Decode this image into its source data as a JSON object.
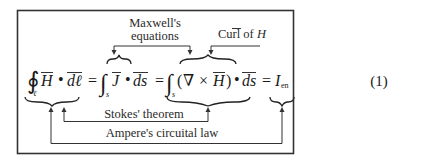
{
  "equation": {
    "number": "(1)",
    "terms": {
      "contour_integral_symbol": "∮",
      "contour_subscript": "ℓ",
      "H": "H",
      "dot": "•",
      "dl": "dℓ",
      "equals": "=",
      "surface_integral_symbol": "∫",
      "surface_subscript": "s",
      "J": "J",
      "ds": "ds",
      "open_paren": "(",
      "nabla": "∇",
      "cross": "×",
      "close_paren": ")",
      "I": "I",
      "I_subscript": "en"
    }
  },
  "annotations": {
    "maxwell_line1": "Maxwell's",
    "maxwell_line2": "equations",
    "curl_prefix": "Curl of ",
    "curl_var": "H",
    "stokes": "Stokes' theorem",
    "ampere": "Ampere's circuital law"
  }
}
